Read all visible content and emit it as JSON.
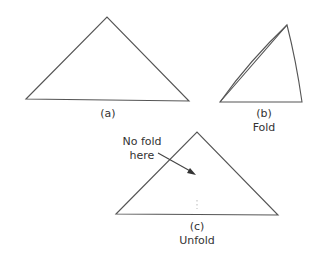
{
  "figure": {
    "panels": [
      {
        "id": "a",
        "label": "(a)",
        "caption": "",
        "shape": "triangle",
        "vertices": {
          "left": [
            26,
            99
          ],
          "apex": [
            107,
            17
          ],
          "right": [
            189,
            101
          ]
        }
      },
      {
        "id": "b",
        "label": "(b)",
        "caption": "Fold",
        "shape": "folded-triangle",
        "vertices": {
          "bottom_left": [
            220,
            102
          ],
          "apex": [
            287,
            25
          ],
          "bottom_right": [
            302,
            102
          ]
        }
      },
      {
        "id": "c",
        "label": "(c)",
        "caption": "Unfold",
        "shape": "triangle",
        "vertices": {
          "left": [
            116,
            214
          ],
          "apex": [
            197,
            132
          ],
          "right": [
            278,
            215
          ]
        }
      }
    ],
    "annotation": {
      "line1": "No fold",
      "line2": "here",
      "arrow_from": [
        158,
        153
      ],
      "arrow_to": [
        195,
        174
      ]
    },
    "colors": {
      "stroke": "#555555",
      "text": "#333333",
      "background": "#ffffff"
    }
  }
}
